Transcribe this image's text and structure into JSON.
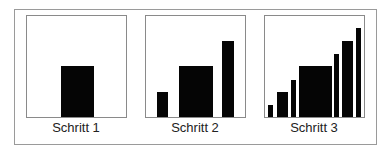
{
  "diagram": {
    "panels": [
      {
        "label": "Schritt 1",
        "bars": [
          {
            "x": 0.34,
            "w": 0.33,
            "h": 0.5
          }
        ]
      },
      {
        "label": "Schritt 2",
        "bars": [
          {
            "x": 0.11,
            "w": 0.11,
            "h": 0.25
          },
          {
            "x": 0.33,
            "w": 0.34,
            "h": 0.5
          },
          {
            "x": 0.77,
            "w": 0.12,
            "h": 0.75
          }
        ]
      },
      {
        "label": "Schritt 3",
        "bars": [
          {
            "x": 0.03,
            "w": 0.05,
            "h": 0.12
          },
          {
            "x": 0.12,
            "w": 0.11,
            "h": 0.25
          },
          {
            "x": 0.26,
            "w": 0.05,
            "h": 0.37
          },
          {
            "x": 0.34,
            "w": 0.33,
            "h": 0.5
          },
          {
            "x": 0.7,
            "w": 0.05,
            "h": 0.62
          },
          {
            "x": 0.78,
            "w": 0.11,
            "h": 0.75
          },
          {
            "x": 0.92,
            "w": 0.05,
            "h": 0.88
          }
        ]
      }
    ]
  }
}
